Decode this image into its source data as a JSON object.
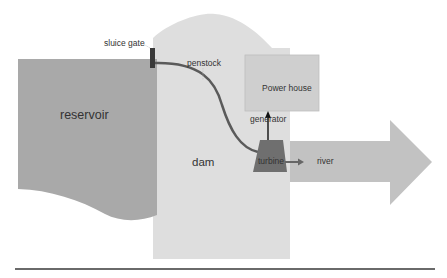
{
  "diagram": {
    "labels": {
      "sluice_gate": "sluice gate",
      "penstock": "penstock",
      "power_house": "Power house",
      "generator": "generator",
      "reservoir": "reservoir",
      "dam": "dam",
      "turbine": "turbine",
      "river": "river"
    },
    "colors": {
      "reservoir": "#a9a9a9",
      "dam": "#dedede",
      "power_house": "#cfcfcf",
      "turbine": "#6f6f6f",
      "river": "#c2c2c2",
      "sluice_gate": "#3a3a3a",
      "penstock": "#5a5a5a",
      "ground_line": "#6a6a6a"
    }
  }
}
